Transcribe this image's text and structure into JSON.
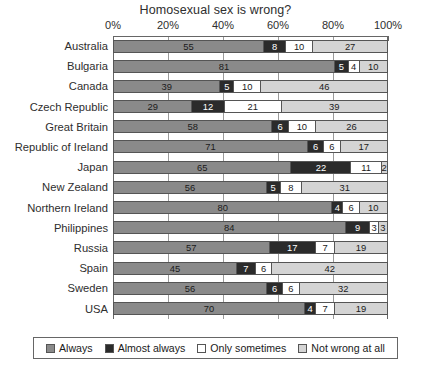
{
  "chart_data": {
    "type": "bar",
    "orientation": "horizontal",
    "stacked": true,
    "stack_mode": "percent",
    "title": "Homosexual sex is wrong?",
    "xlabel": "",
    "ylabel": "",
    "xlim": [
      0,
      100
    ],
    "xtick_labels": [
      "0%",
      "20%",
      "40%",
      "60%",
      "80%",
      "100%"
    ],
    "xtick_values": [
      0,
      20,
      40,
      60,
      80,
      100
    ],
    "grid": true,
    "legend_position": "bottom",
    "categories": [
      "Australia",
      "Bulgaria",
      "Canada",
      "Czech Republic",
      "Great Britain",
      "Republic of Ireland",
      "Japan",
      "New Zealand",
      "Northern Ireland",
      "Philippines",
      "Russia",
      "Spain",
      "Sweden",
      "USA"
    ],
    "series": [
      {
        "name": "Always",
        "color": "#8a8a8a",
        "values": [
          55,
          81,
          39,
          29,
          58,
          71,
          65,
          56,
          80,
          84,
          57,
          45,
          56,
          70
        ]
      },
      {
        "name": "Almost always",
        "color": "#2b2b2b",
        "values": [
          8,
          5,
          5,
          12,
          6,
          6,
          22,
          5,
          4,
          9,
          17,
          7,
          6,
          4
        ]
      },
      {
        "name": "Only sometimes",
        "color": "#ffffff",
        "values": [
          10,
          4,
          10,
          21,
          10,
          6,
          11,
          8,
          6,
          3,
          7,
          6,
          6,
          7
        ]
      },
      {
        "name": "Not wrong at all",
        "color": "#d4d4d4",
        "values": [
          27,
          10,
          46,
          39,
          26,
          17,
          2,
          31,
          10,
          3,
          19,
          42,
          32,
          19
        ]
      }
    ]
  },
  "legend": {
    "items": [
      {
        "label": "Always"
      },
      {
        "label": "Almost always"
      },
      {
        "label": "Only sometimes"
      },
      {
        "label": "Not wrong at all"
      }
    ]
  }
}
